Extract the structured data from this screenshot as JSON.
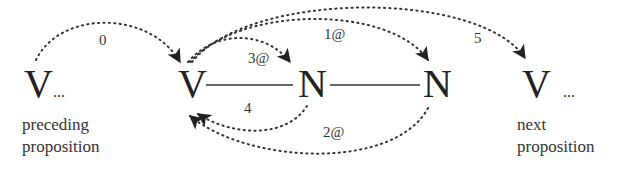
{
  "diagram": {
    "nodes": [
      {
        "id": "v_prev",
        "label": "V",
        "suffix": "..."
      },
      {
        "id": "v_main",
        "label": "V"
      },
      {
        "id": "n1",
        "label": "N"
      },
      {
        "id": "n2",
        "label": "N"
      },
      {
        "id": "v_next",
        "label": "V",
        "suffix": "..."
      }
    ],
    "captions": {
      "preceding": [
        "preceding",
        "proposition"
      ],
      "next": [
        "next",
        "proposition"
      ]
    },
    "edges_solid": [
      {
        "from": "v_main",
        "to": "n1"
      },
      {
        "from": "n1",
        "to": "n2"
      }
    ],
    "arcs": [
      {
        "label": "0",
        "from": "v_prev",
        "to": "v_main",
        "style": "dotted"
      },
      {
        "label": "3@",
        "from": "v_main",
        "to": "n1",
        "style": "dotted"
      },
      {
        "label": "1@",
        "from": "v_main",
        "to": "n2",
        "style": "dotted"
      },
      {
        "label": "5",
        "from": "v_main",
        "to": "v_next",
        "style": "dotted"
      },
      {
        "label": "4",
        "from": "n1",
        "to": "v_main",
        "style": "dotted"
      },
      {
        "label": "2@",
        "from": "n2",
        "to": "v_main",
        "style": "dotted"
      }
    ],
    "colors": {
      "ink": "#222222",
      "background": "#ffffff"
    }
  }
}
